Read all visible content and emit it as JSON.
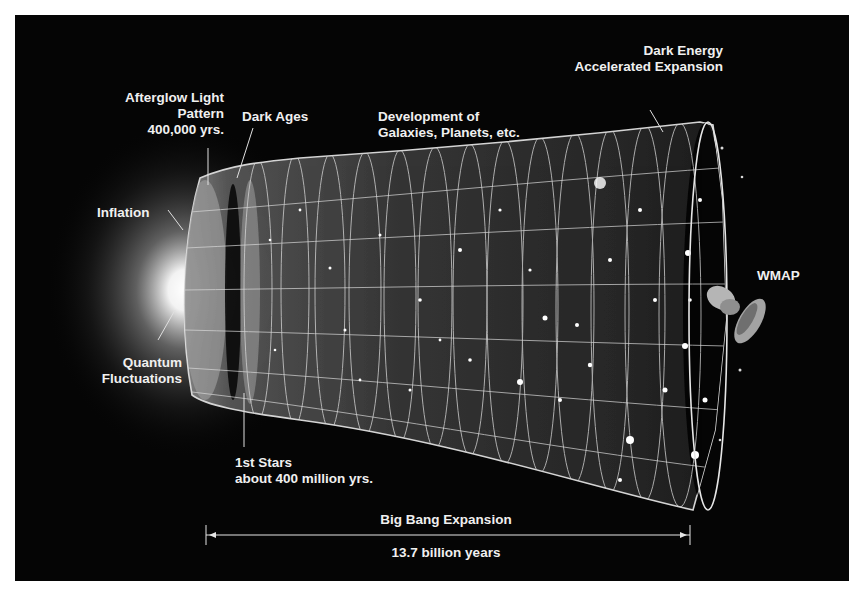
{
  "diagram": {
    "colors": {
      "background": "#050505",
      "frame": "#ffffff",
      "text": "#f0f0f0",
      "grid": "#cfcfcf"
    },
    "labels": {
      "afterglow": {
        "line1": "Afterglow Light",
        "line2": "Pattern",
        "line3": "400,000 yrs."
      },
      "dark_ages": "Dark Ages",
      "development": {
        "line1": "Development of",
        "line2": "Galaxies, Planets, etc."
      },
      "dark_energy": {
        "line1": "Dark Energy",
        "line2": "Accelerated Expansion"
      },
      "inflation": "Inflation",
      "quantum": {
        "line1": "Quantum",
        "line2": "Fluctuations"
      },
      "wmap": "WMAP",
      "first_stars": {
        "line1": "1st Stars",
        "line2": "about 400 million yrs."
      },
      "expansion": "Big Bang Expansion",
      "duration": "13.7 billion years"
    },
    "icons": {
      "satellite": "wmap-satellite-icon",
      "glow": "big-bang-glow-icon"
    }
  }
}
